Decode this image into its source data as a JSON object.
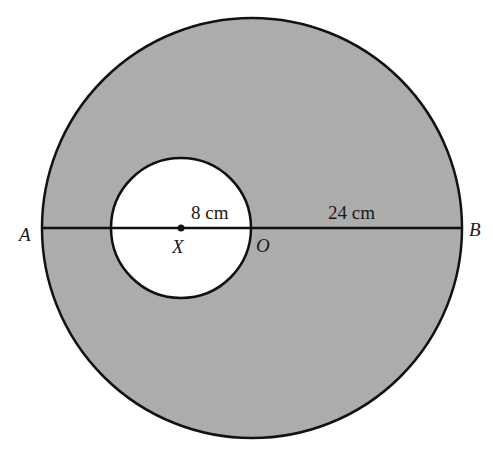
{
  "diagram": {
    "type": "annulus-geometry",
    "colors": {
      "shaded_region": "#a9a9a9",
      "inner_circle_fill": "#ffffff",
      "stroke": "#111111",
      "background": "#ffffff"
    },
    "outer_circle": {
      "center_label": "O",
      "diameter_endpoints": [
        "A",
        "B"
      ]
    },
    "inner_circle": {
      "center_label": "X"
    },
    "points": {
      "A": "A",
      "B": "B",
      "O": "O",
      "X": "X"
    },
    "measurements": {
      "inner_radius": "8 cm",
      "outer_radius": "24 cm"
    }
  }
}
